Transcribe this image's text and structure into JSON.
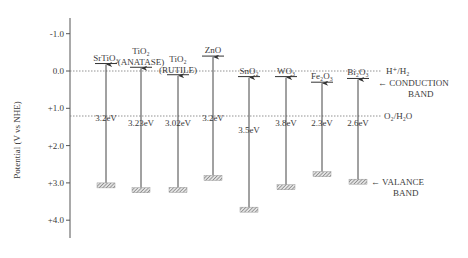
{
  "chart_data": {
    "type": "band-diagram",
    "title": "",
    "ylabel": "Potential (V vs NHE)",
    "yticks": [
      "-1.0",
      "0.0",
      "+1.0",
      "+2.0",
      "+3.0",
      "+4.0"
    ],
    "yvalues": [
      -1.0,
      0.0,
      1.0,
      2.0,
      3.0,
      4.0
    ],
    "ylim": [
      -1.5,
      4.5
    ],
    "reference_lines": [
      {
        "label": "H⁺/H₂",
        "value": 0.0
      },
      {
        "label": "O₂/H₂O",
        "value": 1.23
      }
    ],
    "annotations": {
      "conduction": "← CONDUCTION",
      "conduction2": "BAND",
      "valance": "← VALANCE",
      "valance2": "BAND"
    },
    "materials": [
      {
        "name": "SrTiO₃",
        "sub": "",
        "cb": -0.2,
        "vb": 3.0,
        "gap": "3.2eV"
      },
      {
        "name": "TiO₂",
        "sub": "(ANATASE)",
        "cb": -0.1,
        "vb": 3.13,
        "gap": "3.23eV"
      },
      {
        "name": "TiO₂",
        "sub": "(RUTILE)",
        "cb": 0.1,
        "vb": 3.12,
        "gap": "3.02eV"
      },
      {
        "name": "ZnO",
        "sub": "",
        "cb": -0.4,
        "vb": 2.8,
        "gap": "3.2eV"
      },
      {
        "name": "SnO₂",
        "sub": "",
        "cb": 0.15,
        "vb": 3.65,
        "gap": "3.5eV"
      },
      {
        "name": "WO₃",
        "sub": "",
        "cb": 0.15,
        "vb": 3.05,
        "gap": "3.8eV"
      },
      {
        "name": "Fe₂O₃",
        "sub": "",
        "cb": 0.3,
        "vb": 2.7,
        "gap": "2.3eV"
      },
      {
        "name": "Bi₂O₃",
        "sub": "",
        "cb": 0.2,
        "vb": 2.9,
        "gap": "2.6eV"
      }
    ]
  }
}
